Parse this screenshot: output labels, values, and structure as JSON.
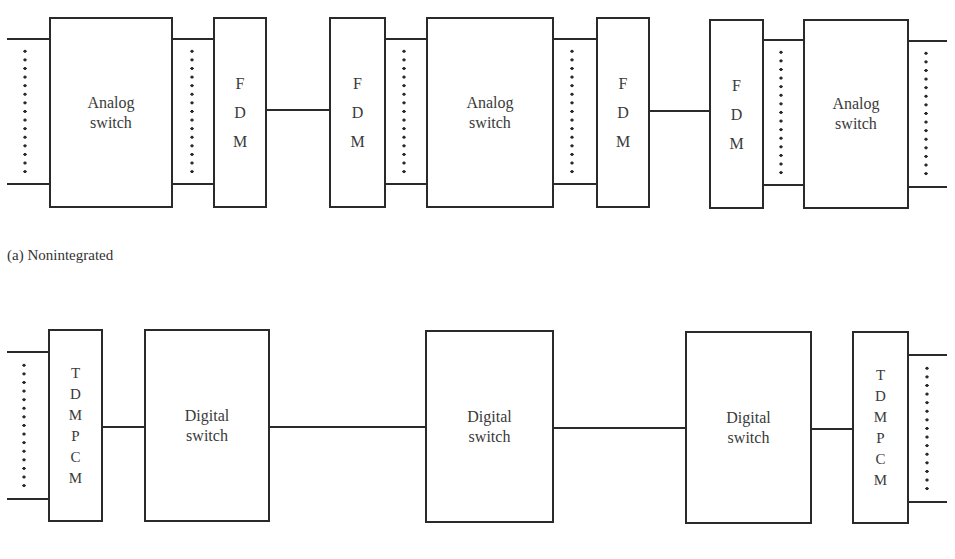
{
  "diagram": {
    "part_a": {
      "caption": "(a)  Nonintegrated",
      "boxes": [
        {
          "id": "analog-switch-1",
          "type": "Analog switch",
          "label": "Analog\nswitch",
          "x": 49,
          "y": 17,
          "w": 124,
          "h": 191
        },
        {
          "id": "fdm-1",
          "type": "FDM",
          "label": "F\nD\nM",
          "x": 213,
          "y": 17,
          "w": 54,
          "h": 191
        },
        {
          "id": "fdm-2",
          "type": "FDM",
          "label": "F\nD\nM",
          "x": 329,
          "y": 17,
          "w": 57,
          "h": 191
        },
        {
          "id": "analog-switch-2",
          "type": "Analog switch",
          "label": "Analog\nswitch",
          "x": 426,
          "y": 17,
          "w": 128,
          "h": 191
        },
        {
          "id": "fdm-3",
          "type": "FDM",
          "label": "F\nD\nM",
          "x": 596,
          "y": 17,
          "w": 54,
          "h": 191
        },
        {
          "id": "fdm-4",
          "type": "FDM",
          "label": "F\nD\nM",
          "x": 709,
          "y": 19,
          "w": 55,
          "h": 190
        },
        {
          "id": "analog-switch-3",
          "type": "Analog switch",
          "label": "Analog\nswitch",
          "x": 803,
          "y": 19,
          "w": 106,
          "h": 190
        }
      ],
      "lines": [
        {
          "x": 7,
          "y": 38,
          "w": 43
        },
        {
          "x": 7,
          "y": 183,
          "w": 43
        },
        {
          "x": 172,
          "y": 38,
          "w": 42
        },
        {
          "x": 172,
          "y": 183,
          "w": 42
        },
        {
          "x": 266,
          "y": 109,
          "w": 64
        },
        {
          "x": 385,
          "y": 38,
          "w": 42
        },
        {
          "x": 385,
          "y": 183,
          "w": 42
        },
        {
          "x": 553,
          "y": 38,
          "w": 44
        },
        {
          "x": 553,
          "y": 183,
          "w": 44
        },
        {
          "x": 649,
          "y": 110,
          "w": 61
        },
        {
          "x": 763,
          "y": 39,
          "w": 41
        },
        {
          "x": 763,
          "y": 184,
          "w": 41
        },
        {
          "x": 908,
          "y": 40,
          "w": 39
        },
        {
          "x": 908,
          "y": 186,
          "w": 39
        }
      ],
      "dot_columns": [
        {
          "x": 25,
          "y": 47,
          "h": 128
        },
        {
          "x": 192,
          "y": 47,
          "h": 128
        },
        {
          "x": 404,
          "y": 47,
          "h": 128
        },
        {
          "x": 572,
          "y": 47,
          "h": 128
        },
        {
          "x": 781,
          "y": 48,
          "h": 128
        },
        {
          "x": 926,
          "y": 49,
          "h": 128
        }
      ]
    },
    "part_b": {
      "boxes": [
        {
          "id": "tdm-pcm-1",
          "type": "TDM PCM",
          "label": "T\nD\nM\nP\nC\nM",
          "x": 48,
          "y": 329,
          "w": 55,
          "h": 193
        },
        {
          "id": "digital-switch-1",
          "type": "Digital switch",
          "label": "Digital\nswitch",
          "x": 144,
          "y": 329,
          "w": 126,
          "h": 193
        },
        {
          "id": "digital-switch-2",
          "type": "Digital switch",
          "label": "Digital\nswitch",
          "x": 425,
          "y": 330,
          "w": 129,
          "h": 193
        },
        {
          "id": "digital-switch-3",
          "type": "Digital switch",
          "label": "Digital\nswitch",
          "x": 685,
          "y": 331,
          "w": 127,
          "h": 193
        },
        {
          "id": "tdm-pcm-2",
          "type": "TDM PCM",
          "label": "T\nD\nM\nP\nC\nM",
          "x": 852,
          "y": 331,
          "w": 57,
          "h": 193
        }
      ],
      "lines": [
        {
          "x": 7,
          "y": 351,
          "w": 42
        },
        {
          "x": 7,
          "y": 498,
          "w": 42
        },
        {
          "x": 102,
          "y": 426,
          "w": 43
        },
        {
          "x": 269,
          "y": 426,
          "w": 157
        },
        {
          "x": 553,
          "y": 427,
          "w": 133
        },
        {
          "x": 811,
          "y": 428,
          "w": 42
        },
        {
          "x": 908,
          "y": 354,
          "w": 39
        },
        {
          "x": 908,
          "y": 501,
          "w": 39
        }
      ],
      "dot_columns": [
        {
          "x": 24,
          "y": 361,
          "h": 130
        },
        {
          "x": 927,
          "y": 364,
          "h": 130
        }
      ]
    }
  }
}
